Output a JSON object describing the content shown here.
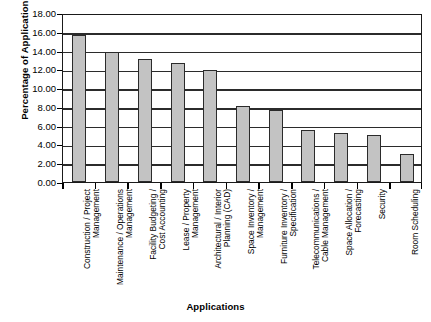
{
  "chart_data": {
    "type": "bar",
    "title": "",
    "xlabel": "Applications",
    "ylabel": "Percentage of Applications",
    "ylim": [
      0,
      18
    ],
    "ytick_step": 2,
    "grid": true,
    "legend": "none",
    "orientation": "vertical",
    "bar_color": "#c3c3c3",
    "bar_edge_color": "#2b2b2b",
    "y_tick_labels": [
      "0.00",
      "2.00",
      "4.00",
      "6.00",
      "8.00",
      "10.00",
      "12.00",
      "14.00",
      "16.00",
      "18.00"
    ],
    "categories": [
      "Construction / Project\nManagement",
      "Maintenance / Operations\nManagement",
      "Facility Budgeting /\nCost Accounting",
      "Lease / Property\nManagement",
      "Architectural / Interior\nPlanning (CAD)",
      "Space Inventory /\nManagement",
      "Furniture Inventory /\nSpecification",
      "Telecommunications /\nCable Management",
      "Space Allocation /\nForecasting",
      "Security",
      "Room Scheduling"
    ],
    "values": [
      15.7,
      13.85,
      13.1,
      12.65,
      11.9,
      8.05,
      7.7,
      5.5,
      5.2,
      5.0,
      3.0
    ]
  }
}
